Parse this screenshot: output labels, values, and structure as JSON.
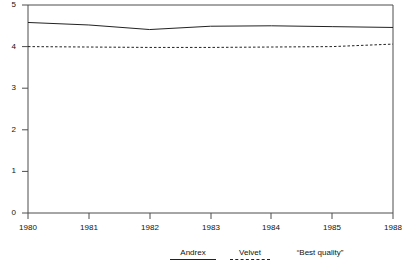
{
  "chart_data": {
    "type": "line",
    "title": "",
    "subtitle": "",
    "xlabel": "",
    "ylabel": "",
    "xlim": [
      1980,
      1988
    ],
    "ylim": [
      0,
      5
    ],
    "grid": false,
    "legend_position": "bottom",
    "x": [
      1980,
      1981,
      1982,
      1983,
      1984,
      1985,
      1988
    ],
    "xtick_labels": [
      "1980",
      "1981",
      "1982",
      "1983",
      "1984",
      "1985",
      "1988"
    ],
    "ytick_labels": [
      "0",
      "1",
      "2",
      "3",
      "4",
      "5"
    ],
    "ytick_values": [
      0,
      1,
      2,
      3,
      4,
      5
    ],
    "series": [
      {
        "name": "Andrex",
        "style": "solid",
        "color": "#222222",
        "values": [
          4.58,
          4.52,
          4.41,
          4.49,
          4.5,
          4.48,
          4.46
        ]
      },
      {
        "name": "Velvet",
        "style": "dashed",
        "color": "#222222",
        "values": [
          4.0,
          3.99,
          3.98,
          3.98,
          3.99,
          4.0,
          4.06
        ]
      }
    ],
    "annotations": [
      {
        "text": "“Best quality”",
        "role": "legend-heading"
      }
    ]
  },
  "legend": {
    "items": [
      {
        "label": "Andrex",
        "marker": "solid-line-swatch"
      },
      {
        "label": "Velvet",
        "marker": "dashed-line-swatch"
      },
      {
        "label": "“Best quality”",
        "marker": "none"
      }
    ]
  },
  "colors": {
    "axis": "#4d4d4d",
    "series_line": "#222222",
    "background": "#ffffff",
    "text": "#111111"
  }
}
